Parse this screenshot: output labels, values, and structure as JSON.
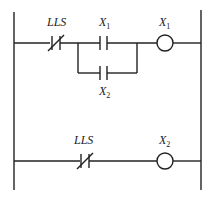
{
  "diagram": {
    "type": "ladder-logic",
    "rungs": [
      {
        "id": 1,
        "elements": [
          {
            "kind": "normally-closed-contact",
            "label": "LLS",
            "label_main": "LLS",
            "label_sub": ""
          },
          {
            "kind": "parallel-branch",
            "branches": [
              {
                "kind": "normally-open-contact",
                "label": "X1",
                "label_main": "X",
                "label_sub": "1"
              },
              {
                "kind": "normally-open-contact",
                "label": "X2",
                "label_main": "X",
                "label_sub": "2"
              }
            ]
          },
          {
            "kind": "coil",
            "label": "X1",
            "label_main": "X",
            "label_sub": "1"
          }
        ]
      },
      {
        "id": 2,
        "elements": [
          {
            "kind": "normally-closed-contact",
            "label": "LLS",
            "label_main": "LLS",
            "label_sub": ""
          },
          {
            "kind": "coil",
            "label": "X2",
            "label_main": "X",
            "label_sub": "2"
          }
        ]
      }
    ]
  },
  "labels": {
    "r1_lls": "LLS",
    "r1_x1_contact": "X",
    "r1_x1_contact_sub": "1",
    "r1_x2_contact": "X",
    "r1_x2_contact_sub": "2",
    "r1_coil": "X",
    "r1_coil_sub": "1",
    "r2_lls": "LLS",
    "r2_coil": "X",
    "r2_coil_sub": "2"
  },
  "colors": {
    "line": "#222222",
    "background": "#ffffff"
  }
}
